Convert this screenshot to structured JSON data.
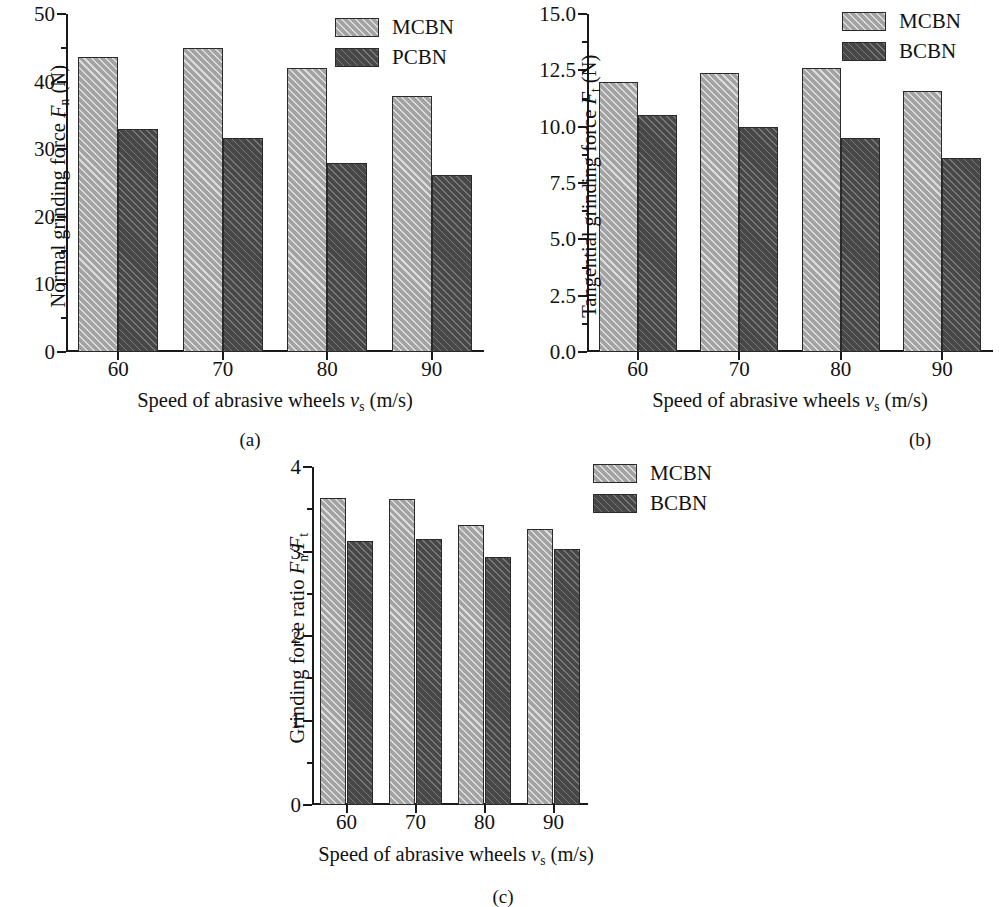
{
  "figure": {
    "panels": [
      {
        "id": "a",
        "caption": "(a)",
        "ylabel_prefix": "Normal grinding force ",
        "ylabel_sym": "F",
        "ylabel_sub": "n",
        "ylabel_suffix": " (N)",
        "xlabel_prefix": "Speed of abrasive wheels ",
        "xlabel_sym": "v",
        "xlabel_sub": "s",
        "xlabel_suffix": " (m/s)",
        "yticks": [
          "0",
          "10",
          "20",
          "30",
          "40",
          "50"
        ],
        "ytickvals": [
          0,
          10,
          20,
          30,
          40,
          50
        ],
        "ylim": [
          0,
          50
        ],
        "xticks": [
          "60",
          "70",
          "80",
          "90"
        ],
        "legend": [
          {
            "label": "MCBN",
            "style": "light"
          },
          {
            "label": "PCBN",
            "style": "dark"
          }
        ]
      },
      {
        "id": "b",
        "caption": "(b)",
        "ylabel_prefix": "Tangential grinding force ",
        "ylabel_sym": "F",
        "ylabel_sub": "t",
        "ylabel_suffix": " (N)",
        "xlabel_prefix": "Speed of abrasive wheels  ",
        "xlabel_sym": "v",
        "xlabel_sub": "s",
        "xlabel_suffix": " (m/s)",
        "yticks": [
          "0.0",
          "2.5",
          "5.0",
          "7.5",
          "10.0",
          "12.5",
          "15.0"
        ],
        "ytickvals": [
          0,
          2.5,
          5.0,
          7.5,
          10.0,
          12.5,
          15.0
        ],
        "ylim": [
          0,
          15
        ],
        "xticks": [
          "60",
          "70",
          "80",
          "90"
        ],
        "legend": [
          {
            "label": "MCBN",
            "style": "light"
          },
          {
            "label": "BCBN",
            "style": "dark"
          }
        ]
      },
      {
        "id": "c",
        "caption": "(c)",
        "ylabel_prefix": "Grinding force ratio ",
        "ylabel_sym": "F",
        "ylabel_sub": "n",
        "ylabel_mid": "/F",
        "ylabel_sub2": "t",
        "ylabel_suffix": "",
        "xlabel_prefix": "Speed of abrasive wheels ",
        "xlabel_sym": "v",
        "xlabel_sub": "s",
        "xlabel_suffix": " (m/s)",
        "yticks": [
          "0",
          "1",
          "2",
          "3",
          "4"
        ],
        "ytickvals": [
          0,
          1,
          2,
          3,
          4
        ],
        "ylim": [
          0,
          4
        ],
        "xticks": [
          "60",
          "70",
          "80",
          "90"
        ],
        "legend": [
          {
            "label": "MCBN",
            "style": "light"
          },
          {
            "label": "BCBN",
            "style": "dark"
          }
        ]
      }
    ],
    "colors": {
      "series_light": "#a3a3a3",
      "series_dark": "#474747",
      "axis": "#1a1a1a",
      "background": "#ffffff"
    }
  },
  "chart_data": [
    {
      "type": "bar",
      "panel": "a",
      "title": "(a) Normal grinding force",
      "xlabel": "Speed of abrasive wheels vs (m/s)",
      "ylabel": "Normal grinding force Fn (N)",
      "categories": [
        "60",
        "70",
        "80",
        "90"
      ],
      "ylim": [
        0,
        50
      ],
      "ytick_labels": [
        "0",
        "10",
        "20",
        "30",
        "40",
        "50"
      ],
      "grid": false,
      "legend_position": "top-right",
      "series": [
        {
          "name": "MCBN",
          "values": [
            43.7,
            45.0,
            42.0,
            37.9
          ]
        },
        {
          "name": "PCBN",
          "values": [
            33.0,
            31.7,
            28.0,
            26.2
          ]
        }
      ]
    },
    {
      "type": "bar",
      "panel": "b",
      "title": "(b) Tangential grinding force",
      "xlabel": "Speed of abrasive wheels vs (m/s)",
      "ylabel": "Tangential grinding force Ft (N)",
      "categories": [
        "60",
        "70",
        "80",
        "90"
      ],
      "ylim": [
        0,
        15
      ],
      "ytick_labels": [
        "0.0",
        "2.5",
        "5.0",
        "7.5",
        "10.0",
        "12.5",
        "15.0"
      ],
      "grid": false,
      "legend_position": "top-right",
      "series": [
        {
          "name": "MCBN",
          "values": [
            12.0,
            12.4,
            12.6,
            11.6
          ]
        },
        {
          "name": "BCBN",
          "values": [
            10.5,
            10.0,
            9.5,
            8.6
          ]
        }
      ]
    },
    {
      "type": "bar",
      "panel": "c",
      "title": "(c) Grinding force ratio",
      "xlabel": "Speed of abrasive wheels vs (m/s)",
      "ylabel": "Grinding force ratio Fn/Ft",
      "categories": [
        "60",
        "70",
        "80",
        "90"
      ],
      "ylim": [
        0,
        4
      ],
      "ytick_labels": [
        "0",
        "1",
        "2",
        "3",
        "4"
      ],
      "grid": false,
      "legend_position": "top-right",
      "series": [
        {
          "name": "MCBN",
          "values": [
            3.63,
            3.62,
            3.31,
            3.27
          ]
        },
        {
          "name": "BCBN",
          "values": [
            3.12,
            3.15,
            2.94,
            3.03
          ]
        }
      ]
    }
  ]
}
